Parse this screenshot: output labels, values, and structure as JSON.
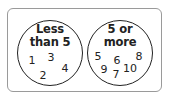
{
  "diagram": {
    "type": "sorting-circles",
    "groups": [
      {
        "label_line1": "Less",
        "label_line2": "than 5",
        "numbers": [
          {
            "value": "1",
            "x": 32,
            "y": 60
          },
          {
            "value": "3",
            "x": 51,
            "y": 57
          },
          {
            "value": "2",
            "x": 43,
            "y": 75
          },
          {
            "value": "4",
            "x": 65,
            "y": 68
          }
        ]
      },
      {
        "label_line1": "5 or",
        "label_line2": "more",
        "numbers": [
          {
            "value": "5",
            "x": 98,
            "y": 56
          },
          {
            "value": "6",
            "x": 117,
            "y": 60
          },
          {
            "value": "8",
            "x": 139,
            "y": 56
          },
          {
            "value": "9",
            "x": 104,
            "y": 69
          },
          {
            "value": "10",
            "x": 130,
            "y": 68
          },
          {
            "value": "7",
            "x": 116,
            "y": 74
          }
        ]
      }
    ]
  }
}
